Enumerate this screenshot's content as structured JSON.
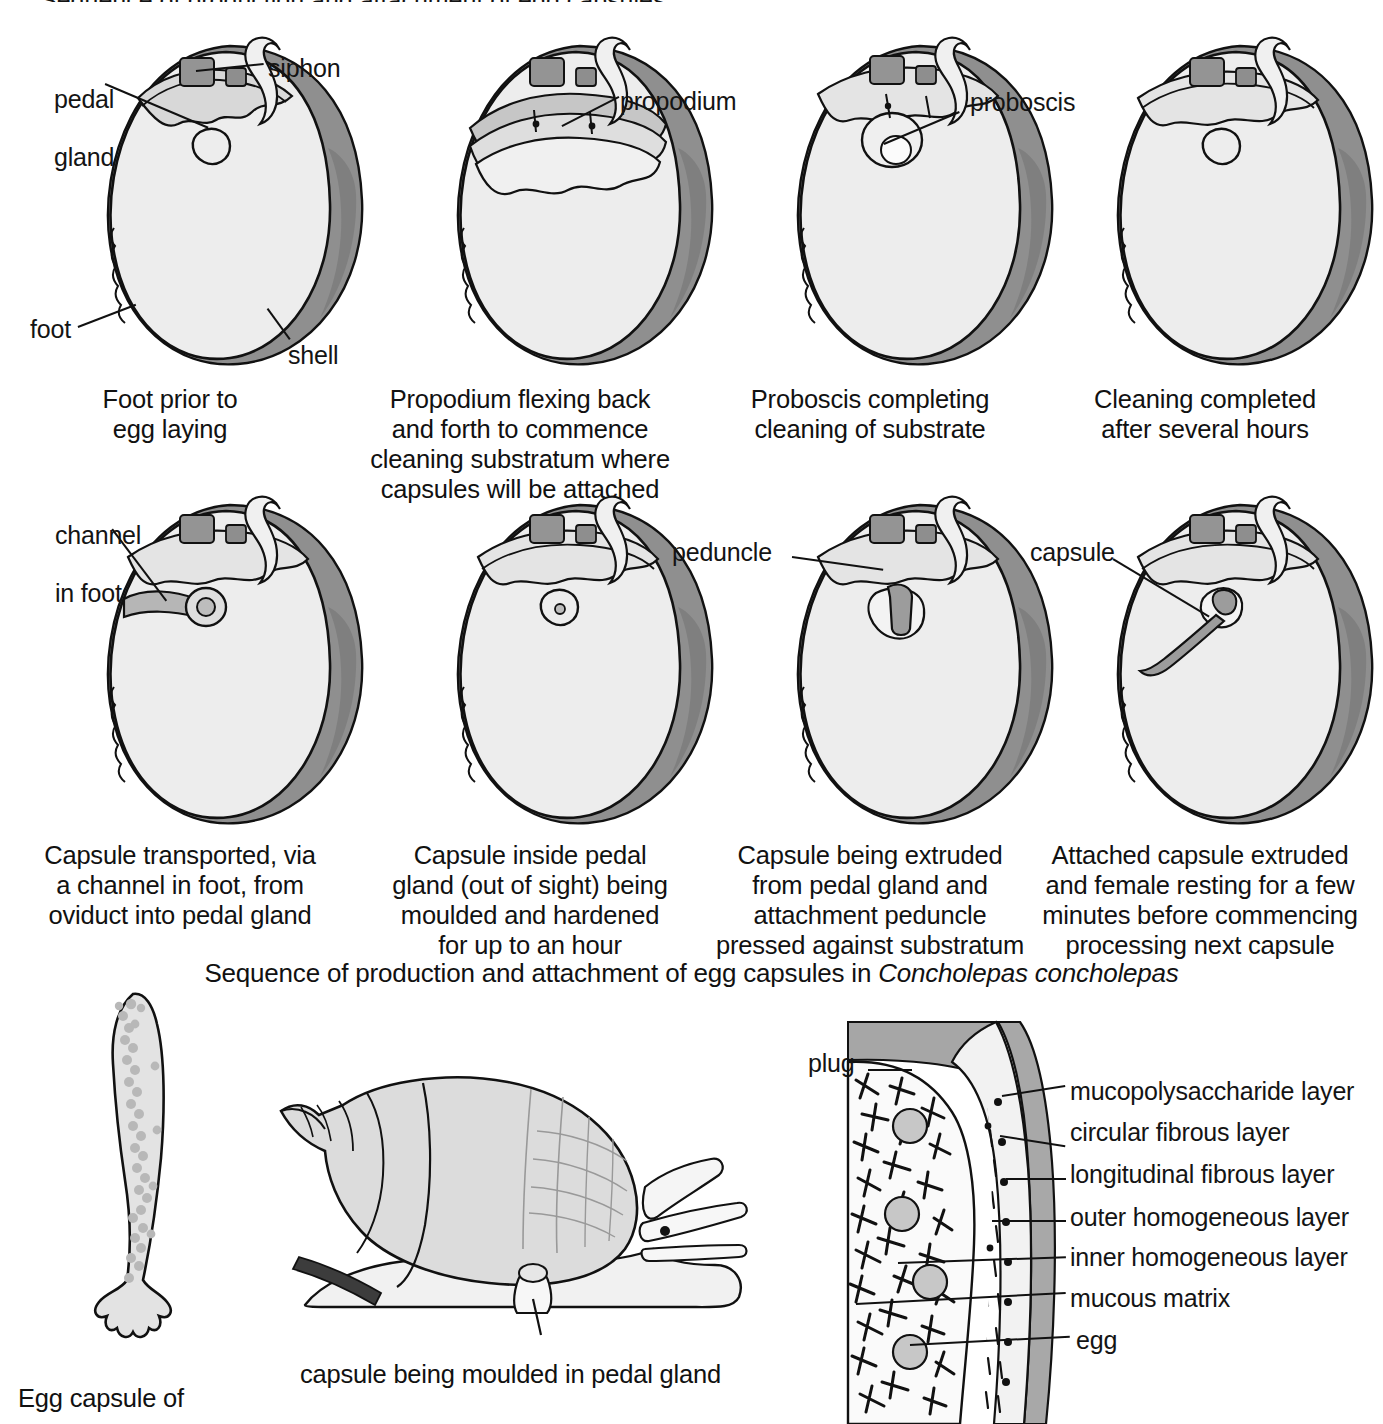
{
  "figure": {
    "top_cutoff_text": "Sequence of production and attachment of egg capsules",
    "sequence_caption_prefix": "Sequence of production and attachment of egg capsules in ",
    "sequence_caption_species": "Concholepas concholepas"
  },
  "row1": {
    "panels": [
      {
        "id": "panel-1",
        "caption": "Foot prior to\negg laying",
        "labels": [
          "pedal\ngland",
          "siphon",
          "foot",
          "shell"
        ]
      },
      {
        "id": "panel-2",
        "caption": "Propodium flexing back\nand forth to commence\ncleaning substratum where\ncapsules will be attached",
        "labels": [
          "propodium"
        ]
      },
      {
        "id": "panel-3",
        "caption": "Proboscis completing\ncleaning of substrate",
        "labels": [
          "proboscis"
        ]
      },
      {
        "id": "panel-4",
        "caption": "Cleaning completed\nafter several hours",
        "labels": []
      }
    ],
    "label_pedal_gland_line1": "pedal",
    "label_pedal_gland_line2": "gland",
    "label_siphon": "siphon",
    "label_foot": "foot",
    "label_shell": "shell",
    "label_propodium": "propodium",
    "label_proboscis": "proboscis"
  },
  "row2": {
    "panels": [
      {
        "id": "panel-5",
        "caption": "Capsule transported, via\na channel in foot, from\noviduct into pedal gland"
      },
      {
        "id": "panel-6",
        "caption": "Capsule inside pedal\ngland (out of sight) being\nmoulded and hardened\nfor up to an hour"
      },
      {
        "id": "panel-7",
        "caption": "Capsule being extruded\nfrom pedal gland and\nattachment peduncle\npressed against substratum"
      },
      {
        "id": "panel-8",
        "caption": "Attached capsule extruded\nand female resting for a few\nminutes before commencing\nprocessing next capsule"
      }
    ],
    "label_channel_line1": "channel",
    "label_channel_line2": "in foot",
    "label_peduncle": "peduncle",
    "label_capsule": "capsule"
  },
  "bottom": {
    "egg_capsule_caption": "Egg capsule of",
    "snail_caption": "capsule being moulded in pedal gland",
    "cross_section": {
      "label_plug": "plug",
      "layer_labels": [
        "mucopolysaccharide layer",
        "circular fibrous layer",
        "longitudinal fibrous layer",
        "outer homogeneous layer",
        "inner homogeneous layer",
        "mucous matrix",
        "egg"
      ]
    }
  },
  "colors": {
    "outline": "#111111",
    "foot_fill": "#ececec",
    "shell_fill": "#9a9a9a",
    "shell_light": "#c4c4c4",
    "plug_fill": "#a8a8a8",
    "egg_fill": "#c9c9c9",
    "matrix_fill": "#f4f4f4",
    "background": "#ffffff"
  }
}
